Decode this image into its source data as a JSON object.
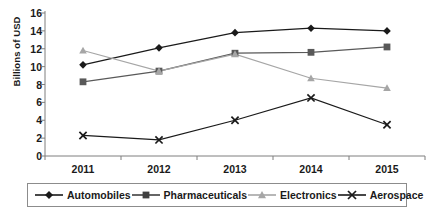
{
  "chart_data": {
    "type": "line",
    "title": "",
    "subtitle": "",
    "xlabel": "",
    "ylabel": "Billions of USD",
    "categories": [
      "2011",
      "2012",
      "2013",
      "2014",
      "2015"
    ],
    "ylim": [
      0,
      16
    ],
    "ytick_step": 2,
    "yticks": [
      "16",
      "14",
      "12",
      "10",
      "8",
      "6",
      "4",
      "2",
      "0"
    ],
    "grid": false,
    "legend_position": "bottom",
    "series": [
      {
        "name": "Automobiles",
        "marker": "diamond",
        "color": "#1a1a1a",
        "values": [
          10.2,
          12.1,
          13.8,
          14.3,
          14.0
        ]
      },
      {
        "name": "Pharmaceuticals",
        "marker": "square",
        "color": "#595959",
        "values": [
          8.3,
          9.5,
          11.5,
          11.6,
          12.2
        ]
      },
      {
        "name": "Electronics",
        "marker": "triangle",
        "color": "#a6a6a6",
        "values": [
          11.8,
          9.5,
          11.4,
          8.7,
          7.6
        ]
      },
      {
        "name": "Aerospace",
        "marker": "cross",
        "color": "#1a1a1a",
        "values": [
          2.3,
          1.8,
          4.0,
          6.5,
          3.5
        ]
      }
    ]
  },
  "axis": {
    "line_color": "#7f7f7f"
  },
  "legend": {
    "items": [
      {
        "label": "Automobiles",
        "marker": "diamond",
        "color": "#1a1a1a"
      },
      {
        "label": "Pharmaceuticals",
        "marker": "square",
        "color": "#404040"
      },
      {
        "label": "Electronics",
        "marker": "triangle",
        "color": "#a6a6a6"
      },
      {
        "label": "Aerospace",
        "marker": "cross",
        "color": "#1a1a1a"
      }
    ]
  }
}
